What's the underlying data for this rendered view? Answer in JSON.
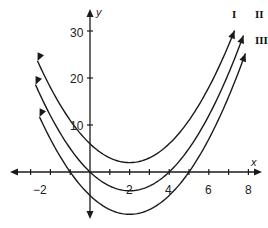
{
  "chart_data": {
    "type": "line",
    "title": "",
    "xlabel": "x",
    "ylabel": "y",
    "xlim": [
      -3,
      8.5
    ],
    "ylim": [
      -10,
      35
    ],
    "x_ticks": [
      -3,
      -2,
      -1,
      0,
      1,
      2,
      3,
      4,
      5,
      6,
      7,
      8
    ],
    "x_tick_labels": [
      "-2",
      "2",
      "4",
      "6",
      "8"
    ],
    "y_ticks": [
      10,
      20,
      30
    ],
    "y_tick_labels": [
      "10",
      "20",
      "30"
    ],
    "grid": false,
    "legend": "curve labels at upper right",
    "series": [
      {
        "name": "I",
        "equation": "y = (x-2)^2 + 2",
        "vertex": [
          2,
          2
        ],
        "y_intercept": 6,
        "x_intercepts": []
      },
      {
        "name": "II",
        "equation": "y = (x-2)^2 - 4",
        "vertex": [
          2,
          -4
        ],
        "y_intercept": 0,
        "x_intercepts": [
          0,
          4
        ]
      },
      {
        "name": "III",
        "equation": "y = (x-2)^2 - 9",
        "vertex": [
          2,
          -9
        ],
        "y_intercept": -5,
        "x_intercepts": [
          -1,
          5
        ]
      }
    ]
  },
  "labels": {
    "x_axis": "x",
    "y_axis": "y",
    "tick_x": [
      "−2",
      "2",
      "4",
      "6",
      "8"
    ],
    "tick_y": [
      "30",
      "20",
      "10"
    ],
    "curves": [
      "I",
      "II",
      "III"
    ]
  }
}
